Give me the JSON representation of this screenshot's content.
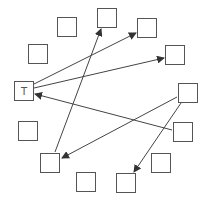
{
  "diagram": {
    "type": "directed-graph-circle",
    "nodes": [
      {
        "id": "n0",
        "label": "",
        "x": 97,
        "y": 8
      },
      {
        "id": "n1",
        "label": "",
        "x": 57,
        "y": 17
      },
      {
        "id": "n2",
        "label": "",
        "x": 137,
        "y": 18
      },
      {
        "id": "n3",
        "label": "",
        "x": 28,
        "y": 44
      },
      {
        "id": "n4",
        "label": "",
        "x": 165,
        "y": 45
      },
      {
        "id": "n5",
        "label": "T",
        "x": 14,
        "y": 81
      },
      {
        "id": "n6",
        "label": "",
        "x": 178,
        "y": 83
      },
      {
        "id": "n7",
        "label": "",
        "x": 18,
        "y": 121
      },
      {
        "id": "n8",
        "label": "",
        "x": 173,
        "y": 122
      },
      {
        "id": "n9",
        "label": "",
        "x": 40,
        "y": 153
      },
      {
        "id": "n10",
        "label": "",
        "x": 151,
        "y": 153
      },
      {
        "id": "n11",
        "label": "",
        "x": 76,
        "y": 172
      },
      {
        "id": "n12",
        "label": "",
        "x": 116,
        "y": 173
      }
    ],
    "edges": [
      {
        "from": "n5",
        "to": "n2"
      },
      {
        "from": "n5",
        "to": "n4"
      },
      {
        "from": "n8",
        "to": "n5"
      },
      {
        "from": "n9",
        "to": "n0"
      },
      {
        "from": "n6",
        "to": "n9"
      },
      {
        "from": "n6",
        "to": "n12"
      }
    ],
    "colors": {
      "stroke": "#555555",
      "arrow": "#333333",
      "background": "#ffffff"
    }
  }
}
